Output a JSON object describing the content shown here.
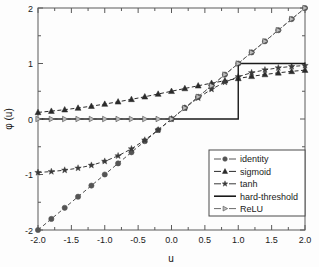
{
  "chart_data": {
    "type": "line",
    "title": "",
    "xlabel": "u",
    "ylabel": "φ (u)",
    "xlim": [
      -2.0,
      2.0
    ],
    "ylim": [
      -2.0,
      2.0
    ],
    "grid": false,
    "legend_position": "lower-right",
    "xticks": [
      "-2.0",
      "-1.5",
      "-1.0",
      "-0.5",
      "0.0",
      "0.5",
      "1.0",
      "1.5",
      "2.0"
    ],
    "xtick_values": [
      -2.0,
      -1.5,
      -1.0,
      -0.5,
      0.0,
      0.5,
      1.0,
      1.5,
      2.0
    ],
    "yticks": [
      "-2",
      "-1",
      "0",
      "1",
      "2"
    ],
    "ytick_values": [
      -2,
      -1,
      0,
      1,
      2
    ],
    "x": [
      -2.0,
      -1.8,
      -1.6,
      -1.4,
      -1.2,
      -1.0,
      -0.8,
      -0.6,
      -0.4,
      -0.2,
      0.0,
      0.2,
      0.4,
      0.6,
      0.8,
      1.0,
      1.2,
      1.4,
      1.6,
      1.8,
      2.0
    ],
    "series": [
      {
        "name": "identity",
        "marker": "circle",
        "linestyle": "dashed",
        "color": "#555555",
        "values": [
          -2.0,
          -1.8,
          -1.6,
          -1.4,
          -1.2,
          -1.0,
          -0.8,
          -0.6,
          -0.4,
          -0.2,
          0.0,
          0.2,
          0.4,
          0.6,
          0.8,
          1.0,
          1.2,
          1.4,
          1.6,
          1.8,
          2.0
        ]
      },
      {
        "name": "sigmoid",
        "marker": "triangle-up",
        "linestyle": "dashed",
        "color": "#2b2b2b",
        "values": [
          0.119,
          0.142,
          0.168,
          0.198,
          0.231,
          0.269,
          0.31,
          0.354,
          0.401,
          0.45,
          0.5,
          0.55,
          0.599,
          0.646,
          0.69,
          0.731,
          0.769,
          0.802,
          0.832,
          0.858,
          0.881
        ]
      },
      {
        "name": "tanh",
        "marker": "star",
        "linestyle": "dashed",
        "color": "#3a3a3a",
        "values": [
          -0.964,
          -0.947,
          -0.922,
          -0.885,
          -0.834,
          -0.762,
          -0.664,
          -0.537,
          -0.38,
          -0.197,
          0.0,
          0.197,
          0.38,
          0.537,
          0.664,
          0.762,
          0.834,
          0.885,
          0.922,
          0.947,
          0.964
        ]
      },
      {
        "name": "hard-threshold",
        "marker": "none",
        "linestyle": "solid",
        "color": "#1a1a1a",
        "values": [
          0.0,
          0.0,
          0.0,
          0.0,
          0.0,
          0.0,
          0.0,
          0.0,
          0.0,
          0.0,
          0.0,
          0.0,
          0.0,
          0.0,
          0.0,
          1.0,
          1.0,
          1.0,
          1.0,
          1.0,
          1.0
        ]
      },
      {
        "name": "ReLU",
        "marker": "triangle-right",
        "linestyle": "dashed",
        "color": "#6a6a6a",
        "values": [
          0.0,
          0.0,
          0.0,
          0.0,
          0.0,
          0.0,
          0.0,
          0.0,
          0.0,
          0.0,
          0.0,
          0.2,
          0.4,
          0.6,
          0.8,
          1.0,
          1.2,
          1.4,
          1.6,
          1.8,
          2.0
        ]
      }
    ]
  },
  "legend": {
    "entries": [
      {
        "label": "identity"
      },
      {
        "label": "sigmoid"
      },
      {
        "label": "tanh"
      },
      {
        "label": "hard-threshold"
      },
      {
        "label": "ReLU"
      }
    ]
  }
}
